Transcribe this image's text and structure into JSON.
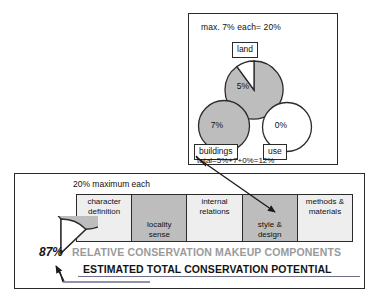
{
  "top_panel": {
    "title": "max. 7% each= 20%",
    "total_text": "total=5%+7+0%=12%",
    "pies": [
      {
        "label": "land",
        "value_text": "5%",
        "value": 5,
        "filled": true,
        "cut_wedge_deg": 36
      },
      {
        "label": "buildings",
        "value_text": "7%",
        "value": 7,
        "filled": true,
        "cut_wedge_deg": 0
      },
      {
        "label": "use",
        "value_text": "0%",
        "value": 0,
        "filled": false,
        "cut_wedge_deg": 0
      }
    ]
  },
  "bottom_panel": {
    "title": "20%  maximum each",
    "components": [
      {
        "label": "character\ndefinition",
        "shade": "light",
        "align": "top"
      },
      {
        "label": "locality\nsense",
        "shade": "dark",
        "align": "bottom"
      },
      {
        "label": "internal\nrelations",
        "shade": "light",
        "align": "top"
      },
      {
        "label": "style &\ndesign",
        "shade": "dark",
        "align": "bottom"
      },
      {
        "label": "methods &\nmaterials",
        "shade": "light",
        "align": "top"
      }
    ],
    "banner_relative": "RELATIVE CONSERVATION MAKEUP COMPONENTS",
    "banner_estimated": "ESTIMATED TOTAL CONSERVATION POTENTIAL",
    "total_pie": {
      "value_text": "87%",
      "value": 87,
      "cut_wedge_deg": 47
    }
  },
  "colors": {
    "pie_fill": "#bdbdbd",
    "pie_stroke": "#2b2b2b",
    "box_light": "#eeeeee",
    "box_dark": "#bdbdbd",
    "banner_gray": "#9a9a9a",
    "banner_black": "#141414",
    "panel_border": "#2b2b2b",
    "underline": "#6f6f8a"
  }
}
